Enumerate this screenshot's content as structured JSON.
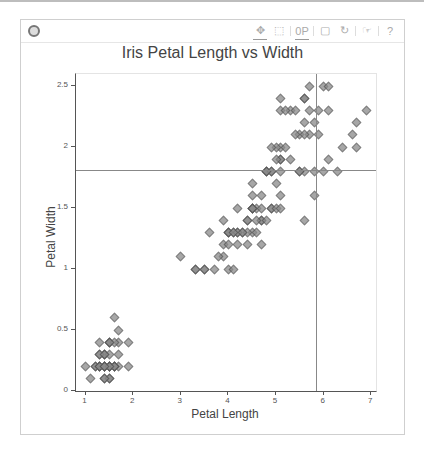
{
  "toolbar": {
    "logo": "bokeh-logo-icon",
    "tools": [
      {
        "name": "pan",
        "glyph": "✥",
        "active": true
      },
      {
        "name": "box-zoom",
        "glyph": "⬚",
        "active": false
      },
      {
        "name": "wheel-zoom",
        "glyph": "0P",
        "active": true
      },
      {
        "name": "save",
        "glyph": "▢",
        "active": false
      },
      {
        "name": "reset",
        "glyph": "↻",
        "active": false
      },
      {
        "name": "hover",
        "glyph": "☞",
        "active": false
      },
      {
        "name": "help",
        "glyph": "?",
        "active": false
      }
    ]
  },
  "chart_data": {
    "type": "scatter",
    "title": "Iris Petal Length vs Width",
    "xlabel": "Petal Length",
    "ylabel": "Petal Width",
    "xlim": [
      0.8,
      7.1
    ],
    "ylim": [
      0,
      2.6
    ],
    "xticks": [
      1,
      2,
      3,
      4,
      5,
      6,
      7
    ],
    "yticks": [
      0,
      0.5,
      1,
      1.5,
      2,
      2.5
    ],
    "ytick_labels": [
      "0",
      "0.5",
      "1",
      "1.5",
      "2",
      "2.5"
    ],
    "marker": "diamond",
    "marker_color": "#8a8a8a",
    "crosshair": {
      "x": 5.83,
      "y": 1.81
    },
    "grid": false,
    "points": [
      [
        1.4,
        0.2
      ],
      [
        1.4,
        0.2
      ],
      [
        1.3,
        0.2
      ],
      [
        1.5,
        0.2
      ],
      [
        1.4,
        0.2
      ],
      [
        1.7,
        0.4
      ],
      [
        1.4,
        0.3
      ],
      [
        1.5,
        0.2
      ],
      [
        1.4,
        0.2
      ],
      [
        1.5,
        0.1
      ],
      [
        1.5,
        0.2
      ],
      [
        1.6,
        0.2
      ],
      [
        1.4,
        0.1
      ],
      [
        1.1,
        0.1
      ],
      [
        1.2,
        0.2
      ],
      [
        1.5,
        0.4
      ],
      [
        1.3,
        0.4
      ],
      [
        1.4,
        0.3
      ],
      [
        1.7,
        0.3
      ],
      [
        1.5,
        0.3
      ],
      [
        1.7,
        0.2
      ],
      [
        1.5,
        0.4
      ],
      [
        1.0,
        0.2
      ],
      [
        1.7,
        0.5
      ],
      [
        1.9,
        0.2
      ],
      [
        1.6,
        0.2
      ],
      [
        1.6,
        0.4
      ],
      [
        1.5,
        0.2
      ],
      [
        1.4,
        0.2
      ],
      [
        1.6,
        0.2
      ],
      [
        1.6,
        0.2
      ],
      [
        1.5,
        0.4
      ],
      [
        1.5,
        0.1
      ],
      [
        1.4,
        0.2
      ],
      [
        1.5,
        0.2
      ],
      [
        1.2,
        0.2
      ],
      [
        1.3,
        0.2
      ],
      [
        1.4,
        0.1
      ],
      [
        1.3,
        0.2
      ],
      [
        1.5,
        0.2
      ],
      [
        1.3,
        0.3
      ],
      [
        1.3,
        0.3
      ],
      [
        1.3,
        0.2
      ],
      [
        1.6,
        0.6
      ],
      [
        1.9,
        0.4
      ],
      [
        1.4,
        0.3
      ],
      [
        1.6,
        0.2
      ],
      [
        1.4,
        0.2
      ],
      [
        1.5,
        0.2
      ],
      [
        1.4,
        0.2
      ],
      [
        4.7,
        1.4
      ],
      [
        4.5,
        1.5
      ],
      [
        4.9,
        1.5
      ],
      [
        4.0,
        1.3
      ],
      [
        4.6,
        1.5
      ],
      [
        4.5,
        1.3
      ],
      [
        4.7,
        1.6
      ],
      [
        3.3,
        1.0
      ],
      [
        4.6,
        1.3
      ],
      [
        3.9,
        1.4
      ],
      [
        3.5,
        1.0
      ],
      [
        4.2,
        1.5
      ],
      [
        4.0,
        1.0
      ],
      [
        4.7,
        1.4
      ],
      [
        3.6,
        1.3
      ],
      [
        4.4,
        1.4
      ],
      [
        4.5,
        1.5
      ],
      [
        4.1,
        1.0
      ],
      [
        4.5,
        1.5
      ],
      [
        3.9,
        1.1
      ],
      [
        4.8,
        1.8
      ],
      [
        4.0,
        1.3
      ],
      [
        4.9,
        1.5
      ],
      [
        4.7,
        1.2
      ],
      [
        4.3,
        1.3
      ],
      [
        4.4,
        1.4
      ],
      [
        4.8,
        1.4
      ],
      [
        5.0,
        1.7
      ],
      [
        4.5,
        1.5
      ],
      [
        3.5,
        1.0
      ],
      [
        3.8,
        1.1
      ],
      [
        3.7,
        1.0
      ],
      [
        3.9,
        1.2
      ],
      [
        5.1,
        1.6
      ],
      [
        4.5,
        1.5
      ],
      [
        4.5,
        1.6
      ],
      [
        4.7,
        1.5
      ],
      [
        4.4,
        1.3
      ],
      [
        4.1,
        1.3
      ],
      [
        4.0,
        1.3
      ],
      [
        4.4,
        1.2
      ],
      [
        4.6,
        1.4
      ],
      [
        4.0,
        1.2
      ],
      [
        3.3,
        1.0
      ],
      [
        4.2,
        1.3
      ],
      [
        4.2,
        1.2
      ],
      [
        4.2,
        1.3
      ],
      [
        4.3,
        1.3
      ],
      [
        3.0,
        1.1
      ],
      [
        4.1,
        1.3
      ],
      [
        6.0,
        2.5
      ],
      [
        5.1,
        1.9
      ],
      [
        5.9,
        2.1
      ],
      [
        5.6,
        1.8
      ],
      [
        5.8,
        2.2
      ],
      [
        6.6,
        2.1
      ],
      [
        4.5,
        1.7
      ],
      [
        6.3,
        1.8
      ],
      [
        5.8,
        1.8
      ],
      [
        6.1,
        2.5
      ],
      [
        5.1,
        2.0
      ],
      [
        5.3,
        1.9
      ],
      [
        5.5,
        2.1
      ],
      [
        5.0,
        2.0
      ],
      [
        5.1,
        2.4
      ],
      [
        5.3,
        2.3
      ],
      [
        5.5,
        1.8
      ],
      [
        6.7,
        2.2
      ],
      [
        6.9,
        2.3
      ],
      [
        5.0,
        1.5
      ],
      [
        5.7,
        2.3
      ],
      [
        4.9,
        2.0
      ],
      [
        6.7,
        2.0
      ],
      [
        4.9,
        1.8
      ],
      [
        5.7,
        2.1
      ],
      [
        6.0,
        1.8
      ],
      [
        4.8,
        1.8
      ],
      [
        4.9,
        1.8
      ],
      [
        5.6,
        2.1
      ],
      [
        5.8,
        1.6
      ],
      [
        6.1,
        1.9
      ],
      [
        6.4,
        2.0
      ],
      [
        5.6,
        2.2
      ],
      [
        5.1,
        1.5
      ],
      [
        5.6,
        1.4
      ],
      [
        6.1,
        2.3
      ],
      [
        5.6,
        2.4
      ],
      [
        5.5,
        1.8
      ],
      [
        4.8,
        1.8
      ],
      [
        5.4,
        2.1
      ],
      [
        5.6,
        2.4
      ],
      [
        5.1,
        2.3
      ],
      [
        5.1,
        1.9
      ],
      [
        5.9,
        2.3
      ],
      [
        5.7,
        2.5
      ],
      [
        5.2,
        2.3
      ],
      [
        5.0,
        1.9
      ],
      [
        5.2,
        2.0
      ],
      [
        5.4,
        2.3
      ],
      [
        5.1,
        1.8
      ]
    ]
  }
}
